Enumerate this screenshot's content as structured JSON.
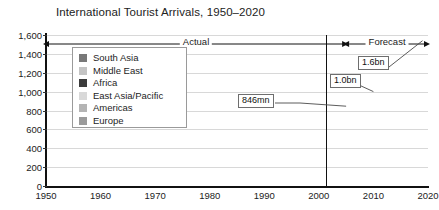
{
  "chart_data": {
    "type": "area",
    "title": "International Tourist Arrivals, 1950–2020",
    "xlabel": "",
    "ylabel": "",
    "stacked": true,
    "grid": true,
    "legend_position": "inside-upper-left",
    "xlim": [
      1950,
      2020
    ],
    "ylim": [
      0,
      1600
    ],
    "y_ticks": [
      "0",
      "200",
      "400",
      "600",
      "800",
      "1,000",
      "1,200",
      "1,400",
      "1,600"
    ],
    "y_tick_values": [
      0,
      200,
      400,
      600,
      800,
      1000,
      1200,
      1400,
      1600
    ],
    "x_ticks": [
      "1950",
      "1960",
      "1970",
      "1980",
      "1990",
      "2000",
      "2010",
      "2020"
    ],
    "x_tick_values": [
      1950,
      1960,
      1970,
      1980,
      1990,
      2000,
      2010,
      2020
    ],
    "x": [
      1950,
      1955,
      1960,
      1965,
      1970,
      1975,
      1980,
      1982,
      1985,
      1990,
      1995,
      2000,
      2002,
      2005,
      2010,
      2015,
      2020
    ],
    "series": [
      {
        "name": "Europe",
        "color": "#9a9a9a",
        "values": [
          16,
          28,
          51,
          85,
          131,
          176,
          200,
          195,
          214,
          265,
          310,
          393,
          400,
          441,
          510,
          580,
          660
        ]
      },
      {
        "name": "Americas",
        "color": "#b4b4b4",
        "values": [
          7,
          10,
          17,
          25,
          42,
          50,
          62,
          58,
          65,
          93,
          109,
          128,
          117,
          133,
          160,
          195,
          235
        ]
      },
      {
        "name": "East Asia/Pacific",
        "color": "#d3d3d3",
        "values": [
          0,
          1,
          3,
          6,
          11,
          17,
          23,
          25,
          32,
          56,
          82,
          111,
          124,
          156,
          230,
          320,
          415
        ]
      },
      {
        "name": "Africa",
        "color": "#3b3b3b",
        "values": [
          0,
          1,
          1,
          2,
          3,
          5,
          7,
          7,
          9,
          15,
          20,
          27,
          29,
          37,
          52,
          70,
          90
        ]
      },
      {
        "name": "Middle East",
        "color": "#c4c4c4",
        "values": [
          0,
          0,
          1,
          2,
          4,
          6,
          7,
          7,
          9,
          10,
          14,
          25,
          28,
          39,
          55,
          80,
          110
        ]
      },
      {
        "name": "South Asia",
        "color": "#787878",
        "values": [
          0,
          0,
          0,
          1,
          1,
          2,
          2,
          2,
          3,
          4,
          4,
          6,
          6,
          8,
          12,
          18,
          26
        ]
      }
    ],
    "annotations": [
      {
        "label": "846mn",
        "x": 2005,
        "y": 846
      },
      {
        "label": "1.0bn",
        "x": 2010,
        "y": 1000
      },
      {
        "label": "1.6bn",
        "x": 2020,
        "y": 1600
      }
    ],
    "phases": [
      {
        "label": "Actual",
        "from": 1950,
        "to": 2005
      },
      {
        "label": "Forecast",
        "from": 2005,
        "to": 2020
      }
    ],
    "divider_year": 2005
  },
  "legend": {
    "items": [
      {
        "label": "South Asia",
        "color": "#787878"
      },
      {
        "label": "Middle East",
        "color": "#c4c4c4"
      },
      {
        "label": "Africa",
        "color": "#3b3b3b"
      },
      {
        "label": "East Asia/Pacific",
        "color": "#d9d9d9"
      },
      {
        "label": "Americas",
        "color": "#b4b4b4"
      },
      {
        "label": "Europe",
        "color": "#9a9a9a"
      }
    ]
  },
  "colors": {
    "axis": "#111111",
    "grid": "#d8d8d8",
    "background": "#ffffff",
    "text": "#222222",
    "callout_border": "#6e6e6e"
  }
}
